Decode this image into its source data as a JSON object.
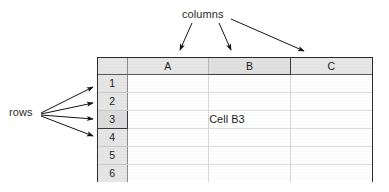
{
  "annotations": {
    "columns_label": "columns",
    "rows_label": "rows",
    "arrow_color": "#1a1a1a"
  },
  "spreadsheet": {
    "corner_label": "",
    "columns": [
      {
        "label": "A",
        "selected": false
      },
      {
        "label": "B",
        "selected": true
      },
      {
        "label": "C",
        "selected": false
      }
    ],
    "rows": [
      {
        "label": "1",
        "selected": false,
        "cells": [
          "",
          "",
          ""
        ]
      },
      {
        "label": "2",
        "selected": false,
        "cells": [
          "",
          "",
          ""
        ]
      },
      {
        "label": "3",
        "selected": true,
        "cells": [
          "",
          "Cell B3",
          ""
        ]
      },
      {
        "label": "4",
        "selected": false,
        "cells": [
          "",
          "",
          ""
        ]
      },
      {
        "label": "5",
        "selected": false,
        "cells": [
          "",
          "",
          ""
        ]
      },
      {
        "label": "6",
        "selected": false,
        "cells": [
          "",
          "",
          ""
        ]
      }
    ],
    "selected_cell": "B3",
    "header_background": "#e6e6e6",
    "grid_line_color": "#d8d8d8",
    "border_color": "#2b2b2b"
  }
}
